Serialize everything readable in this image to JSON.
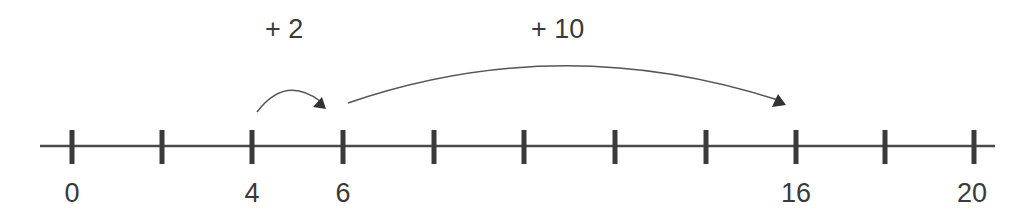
{
  "number_line": {
    "start": 0,
    "end": 20,
    "tick_step": 2,
    "ticks": [
      0,
      2,
      4,
      6,
      8,
      10,
      12,
      14,
      16,
      18,
      20
    ],
    "labeled_values": [
      "0",
      "4",
      "6",
      "16",
      "20"
    ],
    "color": "#3a3a3a"
  },
  "jumps": [
    {
      "label": "+ 2",
      "from": 4,
      "to": 6
    },
    {
      "label": "+ 10",
      "from": 6,
      "to": 16
    }
  ]
}
